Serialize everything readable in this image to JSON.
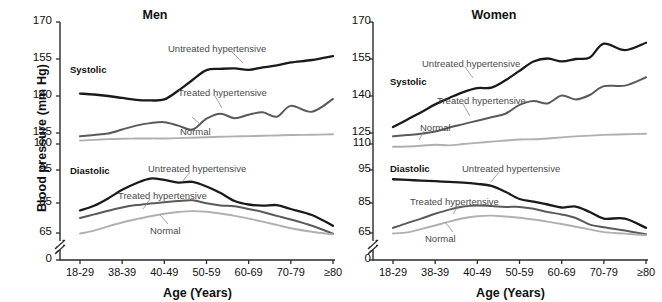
{
  "figure": {
    "ylabel": "Blood pressure (mm Hg)",
    "xlabel_men": "Age (Years)",
    "xlabel_women": "Age (Years)"
  },
  "panels": [
    {
      "key": "men",
      "title": "Men"
    },
    {
      "key": "women",
      "title": "Women"
    }
  ],
  "axis": {
    "yticks": [
      "0",
      "65",
      "85",
      "95",
      "110",
      "125",
      "140",
      "155",
      "170"
    ],
    "ytick_values": [
      0,
      65,
      85,
      95,
      110,
      125,
      140,
      155,
      170
    ],
    "xticks": [
      "18-29",
      "38-39",
      "40-49",
      "50-59",
      "60-69",
      "70-79",
      "≥80"
    ],
    "break_symbol": "//"
  },
  "annotations": {
    "systolic": "Systolic",
    "diastolic": "Diastolic",
    "untreated": "Untreated hypertensive",
    "treated": "Treated hypertensive",
    "normal": "Normal"
  },
  "colors": {
    "untreated": "#1a1a1a",
    "treated": "#5a5a5a",
    "normal": "#b0b0b0",
    "axis": "#2b2b2b",
    "text": "#111111",
    "annotation": "#4a4a4a",
    "background": "#ffffff"
  },
  "chart_data": {
    "type": "line",
    "xlabel": "Age (Years)",
    "ylabel": "Blood pressure (mm Hg)",
    "categories": [
      "18-29",
      "38-39",
      "40-49",
      "50-59",
      "60-69",
      "70-79",
      "≥80"
    ],
    "ylim": [
      0,
      170
    ],
    "yticks": [
      0,
      65,
      85,
      95,
      110,
      125,
      140,
      155,
      170
    ],
    "grid": false,
    "legend": "inline-annotations",
    "note": "y-axis is broken between 0 and 65 and has non-uniform spacing",
    "panels": [
      {
        "name": "Men",
        "groups": [
          {
            "name": "Systolic",
            "series": [
              {
                "name": "Untreated hypertensive",
                "color": "#1a1a1a",
                "x": [
                  18,
                  22,
                  26,
                  30,
                  34,
                  38,
                  42,
                  46,
                  50,
                  54,
                  58,
                  62,
                  66,
                  70,
                  74,
                  78,
                  82,
                  86
                ],
                "values": [
                  141,
                  140.6,
                  140.0,
                  139.2,
                  138.4,
                  138.2,
                  138.6,
                  142.2,
                  146.5,
                  150.5,
                  151.0,
                  151.2,
                  150.6,
                  151.6,
                  152.4,
                  153.6,
                  154.6,
                  156.2
                ]
              },
              {
                "name": "Treated hypertensive",
                "color": "#5a5a5a",
                "x": [
                  18,
                  22,
                  26,
                  30,
                  34,
                  38,
                  42,
                  46,
                  50,
                  54,
                  58,
                  62,
                  66,
                  70,
                  74,
                  78,
                  82,
                  86
                ],
                "values": [
                  120.5,
                  122.4,
                  124.4,
                  126.4,
                  128.0,
                  129.0,
                  129.4,
                  128.0,
                  126.4,
                  130.8,
                  132.8,
                  131.0,
                  132.4,
                  133.4,
                  131.6,
                  136.0,
                  133.6,
                  138.8
                ]
              },
              {
                "name": "Normal",
                "color": "#b0b0b0",
                "x": [
                  18,
                  22,
                  26,
                  30,
                  34,
                  38,
                  42,
                  46,
                  50,
                  54,
                  58,
                  62,
                  66,
                  70,
                  74,
                  78,
                  82,
                  86
                ],
                "values": [
                  114.6,
                  115.6,
                  116.6,
                  117.2,
                  117.4,
                  117.6,
                  117.6,
                  118.0,
                  118.6,
                  119.2,
                  119.8,
                  120.4,
                  120.8,
                  121.2,
                  121.6,
                  122.2,
                  122.6,
                  123.2
                ]
              }
            ]
          },
          {
            "name": "Diastolic",
            "series": [
              {
                "name": "Untreated hypertensive",
                "color": "#1a1a1a",
                "x": [
                  18,
                  22,
                  26,
                  30,
                  34,
                  38,
                  42,
                  46,
                  50,
                  54,
                  58,
                  62,
                  66,
                  70,
                  74,
                  78,
                  82,
                  86
                ],
                "values": [
                  80.0,
                  83.2,
                  86.4,
                  89.0,
                  91.0,
                  92.4,
                  92.0,
                  91.2,
                  91.4,
                  90.0,
                  88.0,
                  85.6,
                  84.0,
                  83.2,
                  83.6,
                  81.0,
                  77.0,
                  69.8
                ]
              },
              {
                "name": "Treated hypertensive",
                "color": "#5a5a5a",
                "x": [
                  18,
                  22,
                  26,
                  30,
                  34,
                  38,
                  42,
                  46,
                  50,
                  54,
                  58,
                  62,
                  66,
                  70,
                  74,
                  78,
                  82,
                  86
                ],
                "values": [
                  75.0,
                  77.4,
                  79.8,
                  82.0,
                  83.6,
                  84.6,
                  85.2,
                  85.6,
                  85.8,
                  84.8,
                  83.4,
                  82.8,
                  81.0,
                  79.0,
                  76.4,
                  74.0,
                  69.8,
                  63.2
                ]
              },
              {
                "name": "Normal",
                "color": "#b0b0b0",
                "x": [
                  18,
                  22,
                  26,
                  30,
                  34,
                  38,
                  42,
                  46,
                  50,
                  54,
                  58,
                  62,
                  66,
                  70,
                  74,
                  78,
                  82,
                  86
                ],
                "values": [
                  63.6,
                  66.6,
                  69.4,
                  72.0,
                  74.2,
                  76.2,
                  77.8,
                  79.0,
                  79.6,
                  79.2,
                  78.0,
                  76.4,
                  74.6,
                  72.6,
                  70.4,
                  68.2,
                  65.8,
                  61.6
                ]
              }
            ]
          }
        ]
      },
      {
        "name": "Women",
        "groups": [
          {
            "name": "Systolic",
            "series": [
              {
                "name": "Untreated hypertensive",
                "color": "#1a1a1a",
                "x": [
                  18,
                  22,
                  26,
                  30,
                  34,
                  38,
                  42,
                  46,
                  50,
                  54,
                  58,
                  62,
                  66,
                  70,
                  74,
                  78,
                  82,
                  86
                ],
                "values": [
                  127.4,
                  130.4,
                  133.4,
                  136.6,
                  139.2,
                  141.6,
                  143.2,
                  143.4,
                  146.4,
                  150.2,
                  154.0,
                  155.2,
                  154.0,
                  155.0,
                  155.6,
                  161.2,
                  158.6,
                  161.6
                ]
              },
              {
                "name": "Treated hypertensive",
                "color": "#5a5a5a",
                "x": [
                  18,
                  22,
                  26,
                  30,
                  34,
                  38,
                  42,
                  46,
                  50,
                  54,
                  58,
                  62,
                  66,
                  70,
                  74,
                  78,
                  82,
                  86
                ],
                "values": [
                  120.4,
                  122.2,
                  124.0,
                  125.6,
                  127.2,
                  128.6,
                  130.0,
                  131.4,
                  132.8,
                  136.4,
                  138.0,
                  137.0,
                  140.2,
                  138.6,
                  140.4,
                  144.0,
                  144.2,
                  147.6
                ]
              },
              {
                "name": "Normal",
                "color": "#b0b0b0",
                "x": [
                  18,
                  22,
                  26,
                  30,
                  34,
                  38,
                  42,
                  46,
                  50,
                  54,
                  58,
                  62,
                  66,
                  70,
                  74,
                  78,
                  82,
                  86
                ],
                "values": [
                  108.4,
                  108.6,
                  109.0,
                  109.6,
                  109.2,
                  110.0,
                  111.6,
                  113.2,
                  114.8,
                  116.2,
                  116.4,
                  117.6,
                  119.0,
                  120.4,
                  121.4,
                  122.4,
                  123.2,
                  124.0
                ]
              }
            ]
          },
          {
            "name": "Diastolic",
            "series": [
              {
                "name": "Untreated hypertensive",
                "color": "#1a1a1a",
                "x": [
                  18,
                  22,
                  26,
                  30,
                  34,
                  38,
                  42,
                  46,
                  50,
                  54,
                  58,
                  62,
                  66,
                  70,
                  74,
                  78,
                  82,
                  86
                ],
                "values": [
                  92.2,
                  92.0,
                  91.8,
                  91.6,
                  91.4,
                  91.2,
                  90.8,
                  90.2,
                  88.4,
                  86.2,
                  85.4,
                  84.0,
                  82.0,
                  82.6,
                  79.0,
                  74.6,
                  74.6,
                  68.4
                ]
              },
              {
                "name": "Treated hypertensive",
                "color": "#5a5a5a",
                "x": [
                  18,
                  22,
                  26,
                  30,
                  34,
                  38,
                  42,
                  46,
                  50,
                  54,
                  58,
                  62,
                  66,
                  70,
                  74,
                  78,
                  82,
                  86
                ],
                "values": [
                  68.4,
                  71.6,
                  74.6,
                  77.8,
                  80.6,
                  82.6,
                  83.4,
                  83.0,
                  82.4,
                  82.4,
                  81.2,
                  79.0,
                  77.4,
                  75.0,
                  70.6,
                  68.8,
                  66.6,
                  62.2
                ]
              },
              {
                "name": "Normal",
                "color": "#b0b0b0",
                "x": [
                  18,
                  22,
                  26,
                  30,
                  34,
                  38,
                  42,
                  46,
                  50,
                  54,
                  58,
                  62,
                  66,
                  70,
                  74,
                  78,
                  82,
                  86
                ],
                "values": [
                  63.8,
                  65.4,
                  67.6,
                  70.0,
                  72.6,
                  74.8,
                  76.2,
                  76.6,
                  76.0,
                  75.2,
                  74.0,
                  72.6,
                  71.0,
                  69.2,
                  67.4,
                  65.6,
                  63.4,
                  59.6
                ]
              }
            ]
          }
        ]
      }
    ]
  }
}
